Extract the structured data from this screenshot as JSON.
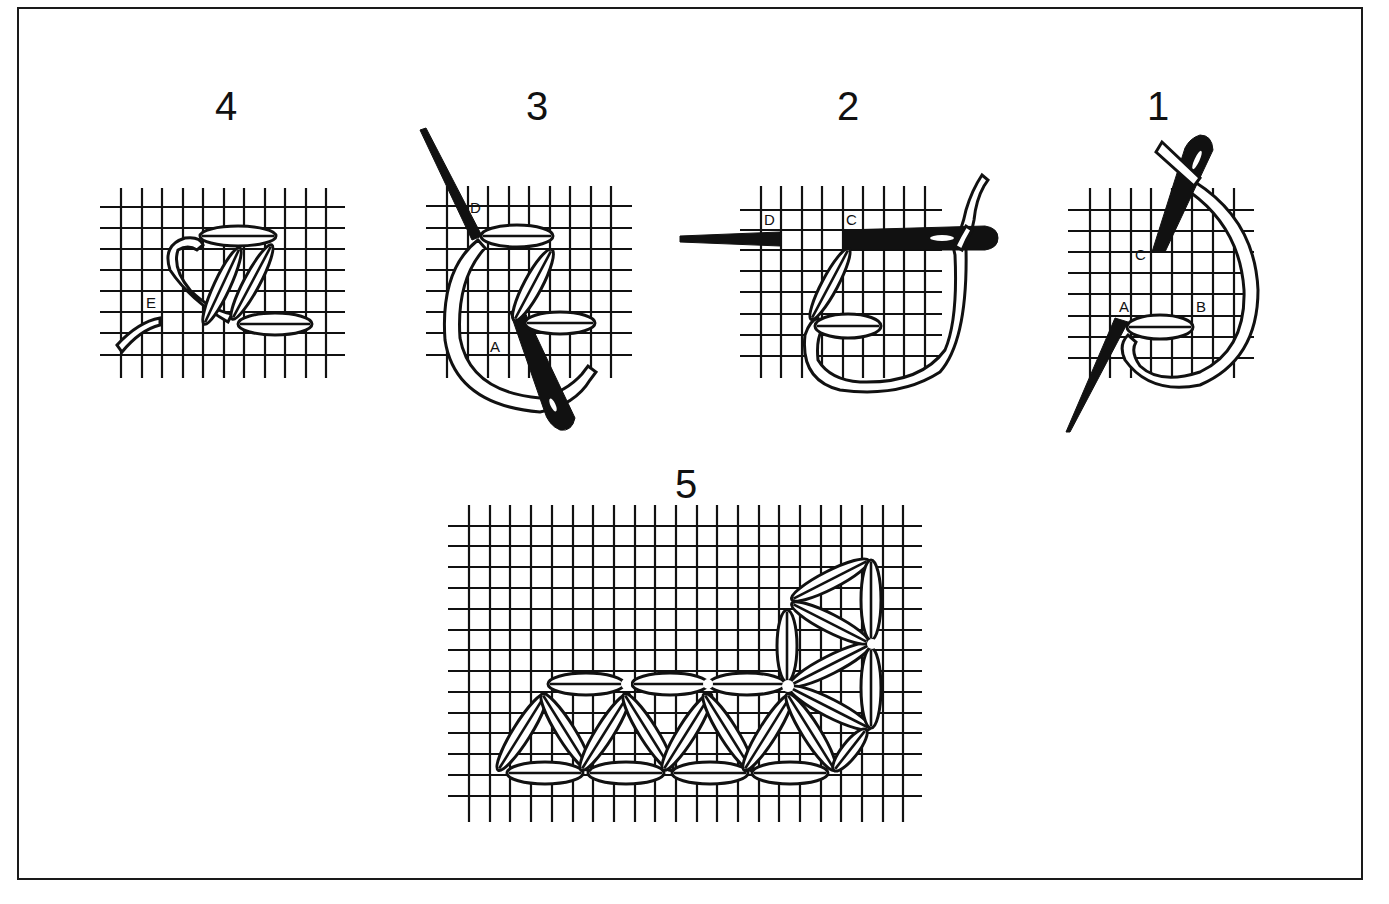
{
  "diagram": {
    "type": "needlework stitch instruction",
    "panels": [
      {
        "id": "4",
        "label": "4",
        "point_labels": [
          "E"
        ]
      },
      {
        "id": "3",
        "label": "3",
        "point_labels": [
          "D",
          "A"
        ]
      },
      {
        "id": "2",
        "label": "2",
        "point_labels": [
          "D",
          "C"
        ]
      },
      {
        "id": "1",
        "label": "1",
        "point_labels": [
          "C",
          "A",
          "B"
        ]
      },
      {
        "id": "5",
        "label": "5",
        "point_labels": []
      }
    ],
    "colors": {
      "ink": "#111111",
      "paper": "#ffffff",
      "frame": "#1a1a1a"
    }
  }
}
